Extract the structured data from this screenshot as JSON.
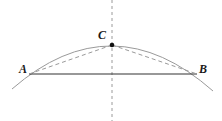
{
  "diagram": {
    "title": "",
    "points": [
      {
        "label": "A",
        "x": 29,
        "y": 74,
        "label_x": 19,
        "label_y": 73
      },
      {
        "label": "B",
        "x": 197,
        "y": 74,
        "label_x": 199,
        "label_y": 73
      },
      {
        "label": "C",
        "x": 112,
        "y": 45,
        "label_x": 98,
        "label_y": 39
      }
    ],
    "elements": [
      {
        "type": "arc",
        "style": "solid",
        "color": "#9a9a9a"
      },
      {
        "type": "chord",
        "from": "A",
        "to": "B",
        "style": "solid",
        "color": "#333333"
      },
      {
        "type": "segment",
        "from": "A",
        "to": "C",
        "style": "dashed",
        "color": "#9a9a9a"
      },
      {
        "type": "segment",
        "from": "C",
        "to": "B",
        "style": "dashed",
        "color": "#9a9a9a"
      },
      {
        "type": "perpendicular-bisector",
        "style": "dashed",
        "color": "#9a9a9a"
      }
    ],
    "colors": {
      "arc": "#9a9a9a",
      "chord": "#333333",
      "dashed": "#9a9a9a",
      "point": "#111111",
      "label": "#1a1a1a"
    }
  }
}
